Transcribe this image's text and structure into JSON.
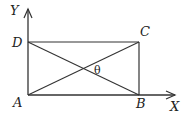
{
  "diagram": {
    "type": "geometry",
    "colors": {
      "line": "#333333",
      "text": "#222222",
      "background": "#ffffff"
    },
    "axes": {
      "x_label": "X",
      "y_label": "Y"
    },
    "points": {
      "A": {
        "label": "A",
        "x": 28,
        "y": 95
      },
      "B": {
        "label": "B",
        "x": 139,
        "y": 95
      },
      "C": {
        "label": "C",
        "x": 139,
        "y": 42
      },
      "D": {
        "label": "D",
        "x": 28,
        "y": 42
      }
    },
    "angle_label": "θ",
    "edges": [
      "AB",
      "BC",
      "CD",
      "DA",
      "AC",
      "BD"
    ]
  }
}
